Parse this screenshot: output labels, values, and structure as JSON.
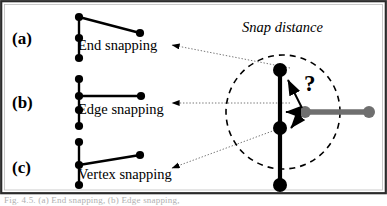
{
  "figure": {
    "background_color": "#ffffff",
    "border_color": "#2b2b2b",
    "ink_color": "#000000",
    "gray_color": "#6f6f6f",
    "caption_text": "Fig. 4.5. (a) End snapping, (b) Edge snapping,"
  },
  "panels": [
    {
      "tag": "(a)",
      "label": "End snapping",
      "description": "vertical-edge-with-three-nodes-and-slanted-edge-from-top-node"
    },
    {
      "tag": "(b)",
      "label": "Edge snapping",
      "description": "vertical-edge-with-four-nodes-and-horizontal-edge-from-second-node"
    },
    {
      "tag": "(c)",
      "label": "Vertex snapping",
      "description": "vertical-edge-with-three-nodes-and-slanted-edge-from-middle-node"
    }
  ],
  "diagram": {
    "snap_distance_label": "Snap distance",
    "question_marker": "?",
    "snap_circle": {
      "cx": 283,
      "cy": 112,
      "r": 57,
      "style": "dashed"
    },
    "target_edge": {
      "color": "#000000",
      "x": 280,
      "y_top": 70,
      "y_bottom": 190,
      "node_positions": [
        70,
        128,
        185
      ]
    },
    "moving_edge": {
      "color": "#6f6f6f",
      "y": 112,
      "x_start": 305,
      "x_end": 369
    },
    "candidate_arrows": [
      "arrow-to-end-node",
      "arrow-to-edge",
      "arrow-to-vertex"
    ]
  },
  "icons": {
    "arrowhead": "triangle-arrowhead",
    "node": "filled-circle-node"
  }
}
